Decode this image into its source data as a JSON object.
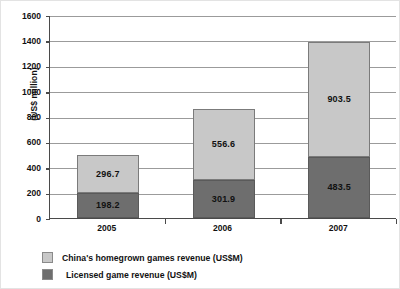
{
  "chart_data": {
    "type": "bar",
    "subtype": "stacked-vertical",
    "title": "",
    "xlabel": "",
    "ylabel": "(US$ million)",
    "categories": [
      "2005",
      "2006",
      "2007"
    ],
    "ylim": [
      0,
      1600
    ],
    "yticks": [
      0,
      200,
      400,
      600,
      800,
      1000,
      1200,
      1400,
      1600
    ],
    "ytick_labels": [
      "0",
      "200",
      "400",
      "600",
      "800",
      "1000",
      "1200",
      "1400",
      "1600"
    ],
    "grid": true,
    "grid_axis": "y",
    "legend_position": "below-left",
    "series": [
      {
        "name": "China's homegrown games revenue (US$M)",
        "color": "#c8c8c8",
        "stack_order": "top",
        "values": [
          296.7,
          556.6,
          903.5
        ],
        "value_labels": [
          "296.7",
          "556.6",
          "903.5"
        ]
      },
      {
        "name": "Licensed game revenue (US$M)",
        "color": "#6e6e6e",
        "stack_order": "bottom",
        "values": [
          198.2,
          301.9,
          483.5
        ],
        "value_labels": [
          "198.2",
          "301.9",
          "483.5"
        ]
      }
    ],
    "totals": [
      494.9,
      858.5,
      1387.0
    ]
  },
  "colors": {
    "homegrown": "#c8c8c8",
    "licensed": "#6e6e6e",
    "gridline": "#9b9b9b",
    "axis": "#4a4a4a",
    "text": "#111111"
  }
}
